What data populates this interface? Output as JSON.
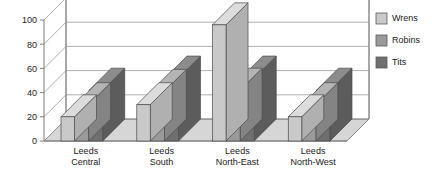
{
  "chart_data": {
    "type": "bar",
    "title": "",
    "subtitle": "",
    "xlabel": "",
    "ylabel": "",
    "ylim": [
      0,
      100
    ],
    "yticks": [
      0,
      20,
      40,
      60,
      80,
      100
    ],
    "ytick_labels": [
      "0",
      "20",
      "40",
      "60",
      "80",
      "100"
    ],
    "grid": true,
    "three_d": true,
    "legend_position": "right",
    "categories": [
      "Leeds Central",
      "Leeds South",
      "Leeds North-East",
      "Leeds North-West"
    ],
    "category_lines": [
      [
        "Leeds",
        "Central"
      ],
      [
        "Leeds",
        "South"
      ],
      [
        "Leeds",
        "North-East"
      ],
      [
        "Leeds",
        "North-West"
      ]
    ],
    "series": [
      {
        "name": "Wrens",
        "color": "#c9c9c9",
        "side_color": "#b0b0b0",
        "top_color": "#dcdcdc",
        "values": [
          20,
          30,
          96,
          20
        ]
      },
      {
        "name": "Robins",
        "color": "#9a9a9a",
        "side_color": "#848484",
        "top_color": "#b4b4b4",
        "values": [
          30,
          41,
          42,
          30
        ]
      },
      {
        "name": "Tits",
        "color": "#6f6f6f",
        "side_color": "#5c5c5c",
        "top_color": "#8c8c8c",
        "values": [
          42,
          52,
          52,
          42
        ]
      }
    ]
  },
  "legend": {
    "items": [
      {
        "label": "Wrens",
        "color": "#c9c9c9"
      },
      {
        "label": "Robins",
        "color": "#9a9a9a"
      },
      {
        "label": "Tits",
        "color": "#6f6f6f"
      }
    ]
  },
  "axis": {
    "y_tick_labels": [
      "100",
      "80",
      "60",
      "40",
      "20",
      "0"
    ]
  },
  "colors": {
    "floor": "#d6d6d6",
    "grid": "#9a9a9a",
    "frame": "#8a8a8a",
    "text": "#1a1a1a",
    "background": "#ffffff"
  }
}
